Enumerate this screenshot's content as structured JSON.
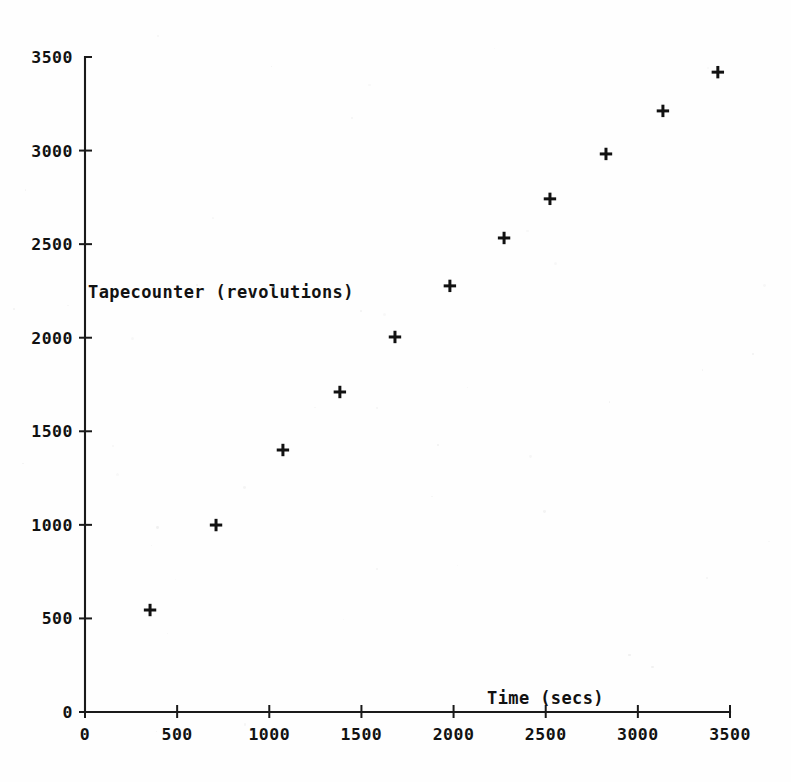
{
  "chart_data": {
    "type": "scatter",
    "title": "",
    "subtitle": "",
    "xlabel": "Time (secs)",
    "ylabel": "Tapecounter (revolutions)",
    "xlim": [
      0,
      3500
    ],
    "ylim": [
      0,
      3500
    ],
    "grid": false,
    "legend": null,
    "marker": "plus",
    "marker_color": "#111111",
    "xticks": [
      0,
      500,
      1000,
      1500,
      2000,
      2500,
      3000,
      3500
    ],
    "xtick_labels": [
      "0",
      "500",
      "1000",
      "1500",
      "2000",
      "2500",
      "3000",
      "3500"
    ],
    "yticks": [
      0,
      500,
      1000,
      1500,
      2000,
      2500,
      3000,
      3500
    ],
    "ytick_labels": [
      "0",
      "500",
      "1000",
      "1500",
      "2000",
      "2500",
      "3000",
      "3500"
    ],
    "x": [
      353,
      711,
      1074,
      1383,
      1682,
      1980,
      2274,
      2523,
      2827,
      3136,
      3434
    ],
    "y": [
      545,
      999,
      1400,
      1710,
      2004,
      2277,
      2533,
      2742,
      2982,
      3212,
      3419
    ],
    "points": [
      {
        "x": 353,
        "y": 545
      },
      {
        "x": 711,
        "y": 999
      },
      {
        "x": 1074,
        "y": 1400
      },
      {
        "x": 1383,
        "y": 1710
      },
      {
        "x": 1682,
        "y": 2004
      },
      {
        "x": 1980,
        "y": 2277
      },
      {
        "x": 2274,
        "y": 2533
      },
      {
        "x": 2523,
        "y": 2742
      },
      {
        "x": 2827,
        "y": 2982
      },
      {
        "x": 3136,
        "y": 3212
      },
      {
        "x": 3434,
        "y": 3419
      }
    ],
    "annotations": [
      {
        "text": "Tapecounter (revolutions)",
        "x": 20,
        "y": 2250,
        "role": "ylabel-inline"
      },
      {
        "text": "Time (secs)",
        "x": 2240,
        "y": 95,
        "role": "xlabel-inline"
      }
    ]
  },
  "figure": {
    "background_color": "#fefefe",
    "axis_color": "#1a1a1a",
    "text_color": "#121212",
    "width": 791,
    "height": 782
  }
}
